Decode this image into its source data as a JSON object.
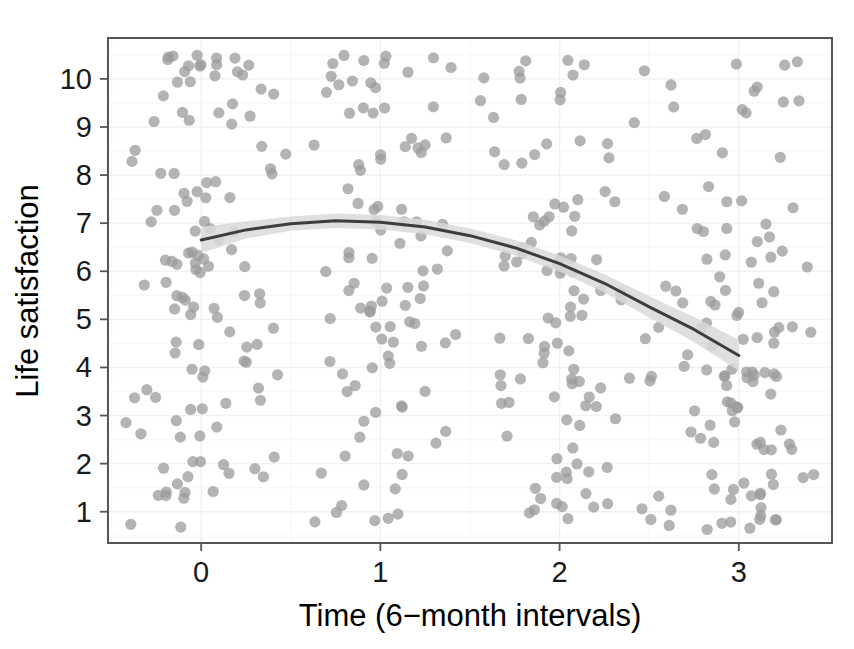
{
  "chart_data": {
    "type": "scatter",
    "title": "",
    "subtitle": "",
    "xlabel": "Time (6−month intervals)",
    "ylabel": "Life satisfaction",
    "xlim": [
      -0.52,
      3.52
    ],
    "ylim": [
      0.35,
      10.85
    ],
    "xticks": [
      0,
      1,
      2,
      3
    ],
    "xtick_labels": [
      "0",
      "1",
      "2",
      "3"
    ],
    "yticks": [
      1,
      2,
      3,
      4,
      5,
      6,
      7,
      8,
      9,
      10
    ],
    "ytick_labels": [
      "1",
      "2",
      "3",
      "4",
      "5",
      "6",
      "7",
      "8",
      "9",
      "10"
    ],
    "grid": true,
    "grid_minor": true,
    "legend": "none",
    "panel_border": true,
    "n_points": 440,
    "point_color": "#9b9b9b",
    "point_opacity": 0.75,
    "point_radius_px": 5.6,
    "fit_line_color": "#3d3d3d",
    "fit_line_width_px": 3.0,
    "confidence_band_color": "#d9d9d9",
    "confidence_band_opacity": 0.85,
    "fit": {
      "type": "quadratic-loess",
      "domain": [
        0,
        3
      ],
      "peak_x": 0.8,
      "peak_y": 7.15,
      "start_y": 6.65,
      "end_y": 4.25,
      "coefficients": {
        "a": -0.62,
        "b": 0.992,
        "c": 6.65
      },
      "points": [
        {
          "x": 0.0,
          "y": 6.65,
          "lo": 6.38,
          "hi": 6.92
        },
        {
          "x": 0.25,
          "y": 6.86,
          "lo": 6.68,
          "hi": 7.04
        },
        {
          "x": 0.5,
          "y": 6.99,
          "lo": 6.84,
          "hi": 7.14
        },
        {
          "x": 0.75,
          "y": 7.05,
          "lo": 6.9,
          "hi": 7.2
        },
        {
          "x": 1.0,
          "y": 7.02,
          "lo": 6.87,
          "hi": 7.17
        },
        {
          "x": 1.25,
          "y": 6.92,
          "lo": 6.77,
          "hi": 7.07
        },
        {
          "x": 1.5,
          "y": 6.74,
          "lo": 6.59,
          "hi": 6.89
        },
        {
          "x": 1.75,
          "y": 6.49,
          "lo": 6.33,
          "hi": 6.65
        },
        {
          "x": 2.0,
          "y": 6.16,
          "lo": 5.99,
          "hi": 6.33
        },
        {
          "x": 2.25,
          "y": 5.75,
          "lo": 5.56,
          "hi": 5.94
        },
        {
          "x": 2.5,
          "y": 5.26,
          "lo": 5.04,
          "hi": 5.48
        },
        {
          "x": 2.75,
          "y": 4.79,
          "lo": 4.53,
          "hi": 5.05
        },
        {
          "x": 3.0,
          "y": 4.25,
          "lo": 3.93,
          "hi": 4.57
        }
      ]
    },
    "x_data_range": [
      -0.42,
      3.42
    ],
    "y_data_range": [
      0.62,
      10.55
    ]
  }
}
